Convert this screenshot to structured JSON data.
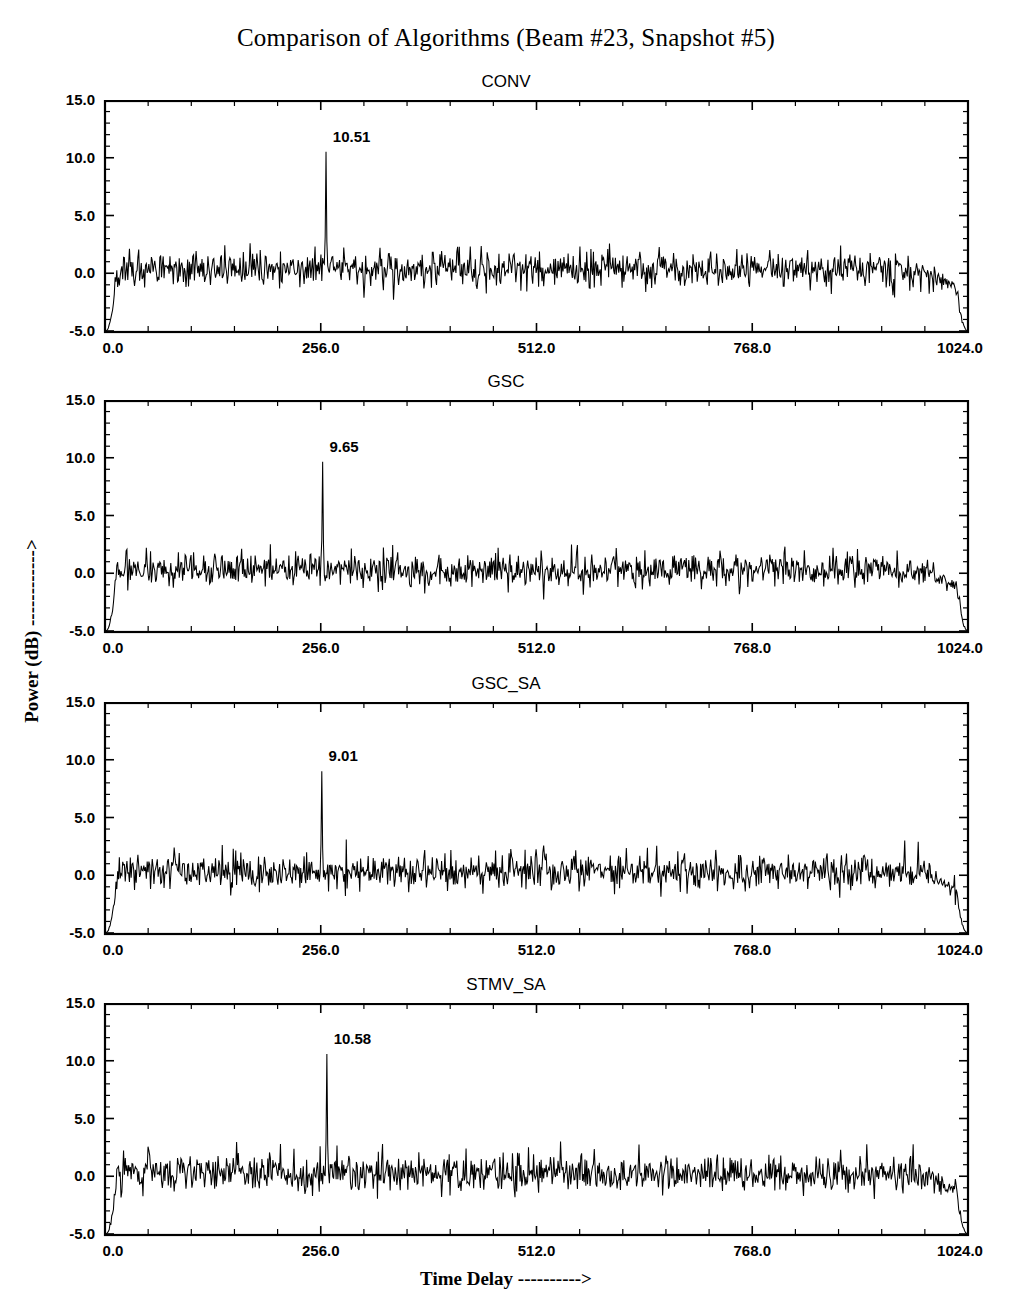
{
  "figure": {
    "title": "Comparison of Algorithms (Beam #23, Snapshot #5)",
    "xlabel": "Time Delay ---------->",
    "ylabel": "Power (dB) ------------>"
  },
  "chart_data": {
    "type": "line",
    "title": "Comparison of Algorithms (Beam #23, Snapshot #5)",
    "xlabel": "Time Delay ---------->",
    "ylabel": "Power (dB) ------------>",
    "grid": false,
    "legend": "none",
    "xlim": [
      0.0,
      1024.0
    ],
    "ylim": [
      -5.0,
      15.0
    ],
    "xticks": [
      0.0,
      256.0,
      512.0,
      768.0,
      1024.0
    ],
    "xtick_labels": [
      "0.0",
      "256.0",
      "512.0",
      "768.0",
      "1024.0"
    ],
    "yticks": [
      -5.0,
      0.0,
      5.0,
      10.0,
      15.0
    ],
    "ytick_labels": [
      "-5.0",
      "0.0",
      "5.0",
      "10.0",
      "15.0"
    ],
    "xminor_count": 4,
    "yminor_count": 4,
    "panels": [
      {
        "name": "CONV",
        "peak_label": "10.51",
        "peak_value": 10.51,
        "peak_x": 262,
        "noise_mean": 0.35,
        "noise_sigma": 0.72,
        "seed": 1771,
        "edge_floor": -5.0,
        "left_rise_x": 14,
        "right_fall_x": 1006,
        "secondary_peaks": [
          {
            "x": 172,
            "y": 2.6
          },
          {
            "x": 420,
            "y": 2.3
          },
          {
            "x": 596,
            "y": 2.1
          },
          {
            "x": 872,
            "y": 2.4
          }
        ]
      },
      {
        "name": "GSC",
        "peak_label": "9.65",
        "peak_value": 9.65,
        "peak_x": 258,
        "noise_mean": 0.3,
        "noise_sigma": 0.68,
        "seed": 5219,
        "edge_floor": -5.0,
        "left_rise_x": 14,
        "right_fall_x": 1008,
        "secondary_peaks": [
          {
            "x": 196,
            "y": 2.5
          },
          {
            "x": 466,
            "y": 2.2
          },
          {
            "x": 640,
            "y": 2.0
          },
          {
            "x": 806,
            "y": 2.3
          }
        ]
      },
      {
        "name": "GSC_SA",
        "peak_label": "9.01",
        "peak_value": 9.01,
        "peak_x": 257,
        "noise_mean": 0.3,
        "noise_sigma": 0.7,
        "seed": 8837,
        "edge_floor": -5.0,
        "left_rise_x": 14,
        "right_fall_x": 1006,
        "secondary_peaks": [
          {
            "x": 286,
            "y": 3.1
          },
          {
            "x": 152,
            "y": 2.3
          },
          {
            "x": 498,
            "y": 2.2
          },
          {
            "x": 948,
            "y": 3.0
          }
        ]
      },
      {
        "name": "STMV_SA",
        "peak_label": "10.58",
        "peak_value": 10.58,
        "peak_x": 263,
        "noise_mean": 0.25,
        "noise_sigma": 0.75,
        "seed": 3391,
        "edge_floor": -5.0,
        "left_rise_x": 14,
        "right_fall_x": 1006,
        "secondary_peaks": [
          {
            "x": 208,
            "y": 2.8
          },
          {
            "x": 428,
            "y": 2.4
          },
          {
            "x": 540,
            "y": 3.0
          },
          {
            "x": 872,
            "y": 2.3
          }
        ]
      }
    ]
  }
}
